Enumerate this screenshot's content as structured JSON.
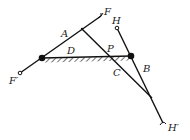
{
  "diagram": {
    "colors": {
      "stroke": "#111111",
      "label": "#222222",
      "background": "#ffffff"
    },
    "labels": {
      "A": "A",
      "B": "B",
      "C": "C",
      "D": "D",
      "P": "P",
      "F": "F",
      "F_prime": "F′",
      "H": "H",
      "H_prime": "H′"
    },
    "points": {
      "F": [
        101,
        16
      ],
      "F_prime": [
        20,
        73
      ],
      "left_pivot": [
        42,
        58
      ],
      "A_joint": [
        82,
        29
      ],
      "right_pivot": [
        131,
        56
      ],
      "H": [
        117,
        28
      ],
      "crossing": [
        152,
        98
      ],
      "H_prime": [
        163,
        123
      ]
    },
    "ground_bar": {
      "from": [
        42,
        58
      ],
      "to": [
        131,
        56
      ],
      "hatched": true
    }
  }
}
